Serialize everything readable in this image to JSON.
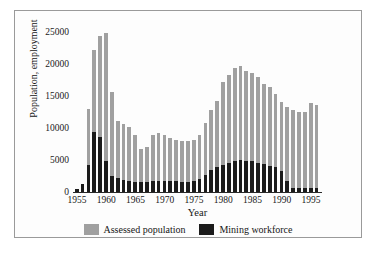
{
  "chart_data": {
    "type": "bar",
    "title": "",
    "xlabel": "Year",
    "ylabel": "Population, employment",
    "xlim": [
      1954.3,
      1996.7
    ],
    "ylim": [
      0,
      26500
    ],
    "grid": false,
    "legend_position": "bottom",
    "bar_style": "overlapping",
    "ytick_labels": [
      "25000",
      "20000",
      "15000",
      "10000",
      "5000",
      "0"
    ],
    "ytick_values": [
      25000,
      20000,
      15000,
      10000,
      5000,
      0
    ],
    "xtick_labels": [
      "1955",
      "1960",
      "1965",
      "1970",
      "1975",
      "1980",
      "1985",
      "1990",
      "1995"
    ],
    "xtick_values": [
      1955,
      1960,
      1965,
      1970,
      1975,
      1980,
      1985,
      1990,
      1995
    ],
    "categories": [
      1955,
      1956,
      1957,
      1958,
      1959,
      1960,
      1961,
      1962,
      1963,
      1964,
      1965,
      1966,
      1967,
      1968,
      1969,
      1970,
      1971,
      1972,
      1973,
      1974,
      1975,
      1976,
      1977,
      1978,
      1979,
      1980,
      1981,
      1982,
      1983,
      1984,
      1985,
      1986,
      1987,
      1988,
      1989,
      1990,
      1991,
      1992,
      1993,
      1994,
      1995,
      1996
    ],
    "series": [
      {
        "name": "Assessed population",
        "color": "#a0a0a0",
        "values": [
          400,
          1300,
          13000,
          22300,
          24400,
          24900,
          15700,
          11100,
          10600,
          10200,
          9000,
          6700,
          7100,
          8900,
          9300,
          8900,
          8500,
          8200,
          8000,
          8000,
          8200,
          9000,
          10800,
          12900,
          14300,
          17300,
          18300,
          19500,
          19700,
          19000,
          18700,
          18100,
          17000,
          16500,
          15400,
          14100,
          13300,
          12800,
          12600,
          12500,
          13900,
          13600
        ]
      },
      {
        "name": "Mining workforce",
        "color": "#1b1b1b",
        "values": [
          400,
          1300,
          4300,
          9400,
          8700,
          4800,
          2500,
          2200,
          1900,
          1700,
          1600,
          1550,
          1600,
          1700,
          1700,
          1700,
          1700,
          1700,
          1600,
          1600,
          1700,
          2000,
          2600,
          3400,
          3900,
          4300,
          4600,
          4900,
          5000,
          4900,
          4800,
          4500,
          4400,
          4100,
          3900,
          3300,
          1800,
          700,
          700,
          700,
          700,
          700
        ]
      }
    ]
  },
  "legend": {
    "items": [
      {
        "label": "Assessed population",
        "color": "#a0a0a0"
      },
      {
        "label": "Mining workforce",
        "color": "#1b1b1b"
      }
    ]
  }
}
